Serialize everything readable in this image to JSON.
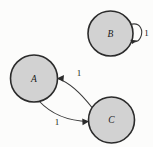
{
  "diagram": {
    "type": "state-transition-graph",
    "background_color": "#fcfcfb",
    "node_fill_color": "#d2d2d2",
    "node_stroke_color": "#2b2b2b",
    "edge_color": "#3a3a3a",
    "nodes": [
      {
        "id": "B",
        "label": "B",
        "cx": 110.5,
        "cy": 33.5,
        "r": 22.5
      },
      {
        "id": "A",
        "label": "A",
        "cx": 34.0,
        "cy": 78.5,
        "r": 23.5
      },
      {
        "id": "C",
        "label": "C",
        "cx": 111.5,
        "cy": 120.0,
        "r": 23.0
      }
    ],
    "edges": [
      {
        "id": "b-self-loop",
        "from": "B",
        "to": "B",
        "label": "1",
        "kind": "self-loop",
        "label_x": 146,
        "label_y": 33
      },
      {
        "id": "c-to-a",
        "from": "C",
        "to": "A",
        "label": "1",
        "kind": "curve",
        "label_x": 79,
        "label_y": 73
      },
      {
        "id": "a-to-c",
        "from": "A",
        "to": "C",
        "label": "1",
        "kind": "curve",
        "label_x": 57,
        "label_y": 122
      }
    ]
  }
}
